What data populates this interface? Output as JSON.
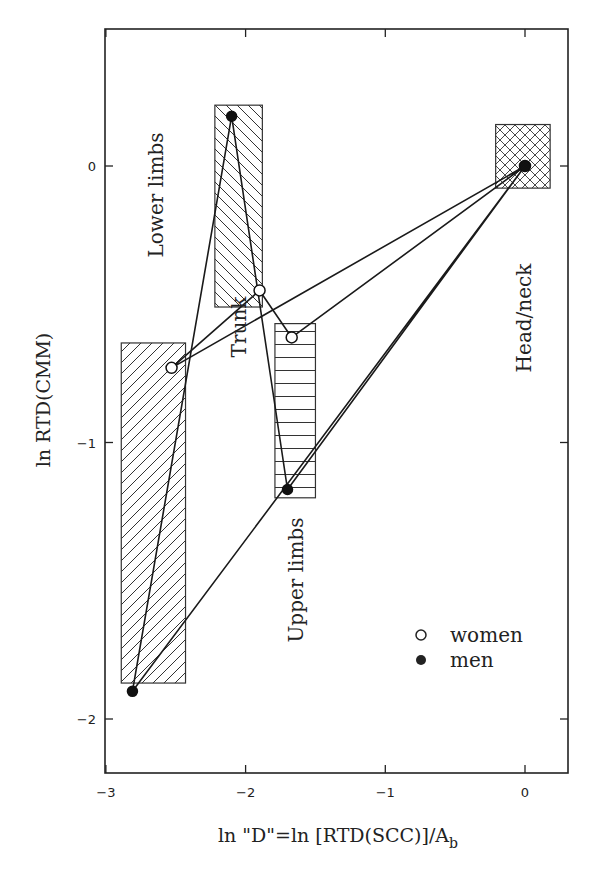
{
  "chart_data": {
    "type": "scatter",
    "title": "",
    "xlabel": "ln \"D\"=ln [RTD(SCC)]/A",
    "xlabel_subscript": "b",
    "ylabel": "ln RTD(CMM)",
    "xlim": [
      -3,
      0.2
    ],
    "ylim": [
      -2.2,
      0.45
    ],
    "x_ticks": [
      -3,
      -2,
      -1,
      0
    ],
    "x_tick_labels": [
      "−3",
      "−2",
      "−1",
      "0"
    ],
    "y_ticks": [
      0,
      -1,
      -2
    ],
    "y_tick_labels": [
      "0",
      "−1",
      "−2"
    ],
    "grid": false,
    "legend": {
      "position": "bottom-right",
      "entries": [
        {
          "name": "women",
          "marker": "open-circle"
        },
        {
          "name": "men",
          "marker": "filled-circle"
        }
      ]
    },
    "regions": [
      {
        "name": "Lower limbs",
        "x": [
          -2.89,
          -2.43
        ],
        "y": [
          -1.87,
          -0.64
        ],
        "hatch": "diagonal-up"
      },
      {
        "name": "Trunk",
        "x": [
          -2.22,
          -1.88
        ],
        "y": [
          -0.51,
          0.22
        ],
        "hatch": "diagonal-down"
      },
      {
        "name": "Upper limbs",
        "x": [
          -1.79,
          -1.5
        ],
        "y": [
          -1.2,
          -0.57
        ],
        "hatch": "horizontal"
      },
      {
        "name": "Head/neck",
        "x": [
          -0.21,
          0.18
        ],
        "y": [
          -0.08,
          0.15
        ],
        "hatch": "crosshatch"
      }
    ],
    "series": [
      {
        "name": "women",
        "marker": "open-circle",
        "points": [
          {
            "region": "Lower limbs",
            "x": -2.53,
            "y": -0.73
          },
          {
            "region": "Trunk",
            "x": -1.9,
            "y": -0.45
          },
          {
            "region": "Upper limbs",
            "x": -1.67,
            "y": -0.62
          },
          {
            "region": "Head/neck",
            "x": 0.0,
            "y": 0.0
          }
        ]
      },
      {
        "name": "men",
        "marker": "filled-circle",
        "points": [
          {
            "region": "Lower limbs",
            "x": -2.81,
            "y": -1.9
          },
          {
            "region": "Trunk",
            "x": -2.1,
            "y": 0.18
          },
          {
            "region": "Upper limbs",
            "x": -1.7,
            "y": -1.17
          },
          {
            "region": "Head/neck",
            "x": 0.0,
            "y": 0.0
          }
        ]
      }
    ]
  }
}
